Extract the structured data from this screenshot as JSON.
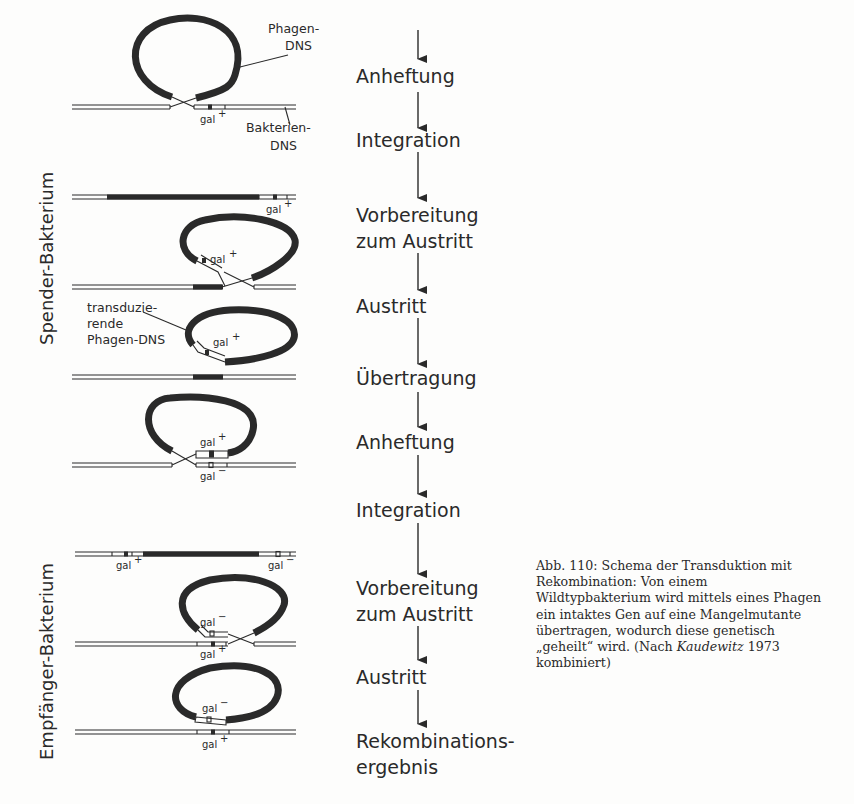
{
  "figure": {
    "side_labels": {
      "donor": "Spender-Bakterium",
      "recipient": "Empfänger-Bakterium"
    },
    "annotations": {
      "phage_dna_1": "Phagen-",
      "phage_dna_2": "DNS",
      "bact_dna_1": "Bakterien-",
      "bact_dna_2": "DNS",
      "transducing_1": "transduzie-",
      "transducing_2": "rende",
      "transducing_3": "Phagen-DNS"
    },
    "gene_labels": {
      "gal_plus": "gal",
      "gal_minus": "gal",
      "plus": "+",
      "minus": "−"
    },
    "steps": [
      {
        "label": "Anheftung"
      },
      {
        "label": "Integration"
      },
      {
        "label_1": "Vorbereitung",
        "label_2": "zum Austritt"
      },
      {
        "label": "Austritt"
      },
      {
        "label": "Übertragung"
      },
      {
        "label": "Anheftung"
      },
      {
        "label": "Integration"
      },
      {
        "label_1": "Vorbereitung",
        "label_2": "zum Austritt"
      },
      {
        "label": "Austritt"
      },
      {
        "label_1": "Rekombinations-",
        "label_2": "ergebnis"
      }
    ],
    "colors": {
      "ink": "#2a2a2a",
      "paper": "#fdfdfc"
    }
  },
  "caption": {
    "prefix": "Abb. 110: Schema der Transduktion mit Rekombination: Von einem Wildtypbakterium wird mittels eines Phagen ein intaktes Gen auf eine Mangelmutante übertragen, wodurch diese genetisch „geheilt“ wird. (Nach ",
    "author": "Kaudewitz",
    "suffix": " 1973 kombiniert)"
  }
}
